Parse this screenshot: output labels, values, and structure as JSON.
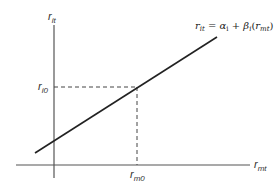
{
  "diagram": {
    "type": "linear regression characteristic line",
    "y_axis": {
      "label_main": "r",
      "label_sub": "it"
    },
    "x_axis": {
      "label_main": "r",
      "label_sub": "mt"
    },
    "y_marker": {
      "label_main": "r",
      "label_sub": "i0"
    },
    "x_marker": {
      "label_main": "r",
      "label_sub": "m0"
    },
    "equation": {
      "lhs_main": "r",
      "lhs_sub": "it",
      "eq": " = ",
      "alpha": "α",
      "alpha_sub": "i",
      "plus": " + ",
      "beta": "β",
      "beta_sub": "i",
      "paren_open": "(",
      "arg_main": "r",
      "arg_sub": "mt",
      "paren_close": ")"
    },
    "colors": {
      "axis": "#555555",
      "line": "#222222",
      "dash": "#444444",
      "text": "#333333"
    }
  }
}
